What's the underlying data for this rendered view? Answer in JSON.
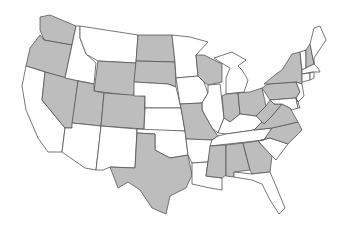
{
  "map": {
    "title": "United States",
    "colors": {
      "shaded": "#bdbdbd",
      "unshaded": "#ffffff",
      "border": "#555555"
    },
    "shaded_states": [
      "WA",
      "OR",
      "NV",
      "UT",
      "CO",
      "WY",
      "ND",
      "SD",
      "WI",
      "MO",
      "TX",
      "MS",
      "AL",
      "GA",
      "NC",
      "VA",
      "WV",
      "OH",
      "IN",
      "PA",
      "NY",
      "NH"
    ],
    "unshaded_states": [
      "CA",
      "ID",
      "MT",
      "AZ",
      "NM",
      "NE",
      "KS",
      "OK",
      "MN",
      "IA",
      "IL",
      "MI",
      "KY",
      "TN",
      "AR",
      "LA",
      "FL",
      "SC",
      "ME",
      "VT",
      "MA",
      "CT",
      "RI",
      "NJ",
      "DE",
      "MD"
    ]
  }
}
